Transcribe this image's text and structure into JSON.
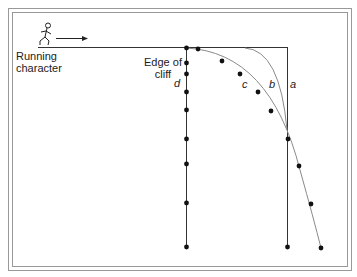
{
  "diagram": {
    "character_label_line1": "Running",
    "character_label_line2": "character",
    "cliff_label_line1": "Edge of",
    "cliff_label_line2": "cliff",
    "path_labels": {
      "a": "a",
      "b": "b",
      "c": "c",
      "d": "d"
    },
    "colors": {
      "line": "#333333",
      "curve": "#8a8a8a",
      "dot": "#111111",
      "frame": "#888888"
    }
  }
}
